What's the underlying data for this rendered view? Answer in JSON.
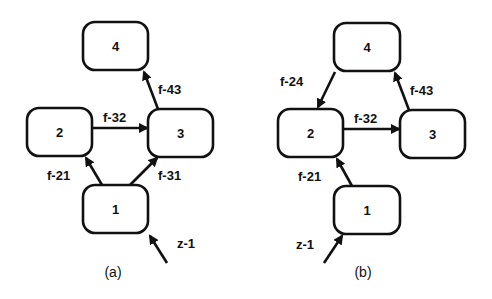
{
  "panels": [
    {
      "label": "(a)",
      "nodes": [
        {
          "id": "4",
          "label": "4"
        },
        {
          "id": "2",
          "label": "2"
        },
        {
          "id": "3",
          "label": "3"
        },
        {
          "id": "1",
          "label": "1"
        }
      ],
      "edges": [
        {
          "from": "1",
          "to": "2",
          "label": "f-21"
        },
        {
          "from": "1",
          "to": "3",
          "label": "f-31"
        },
        {
          "from": "2",
          "to": "3",
          "label": "f-32"
        },
        {
          "from": "3",
          "to": "4",
          "label": "f-43"
        }
      ],
      "input": {
        "to": "1",
        "label": "z-1"
      }
    },
    {
      "label": "(b)",
      "nodes": [
        {
          "id": "4",
          "label": "4"
        },
        {
          "id": "2",
          "label": "2"
        },
        {
          "id": "3",
          "label": "3"
        },
        {
          "id": "1",
          "label": "1"
        }
      ],
      "edges": [
        {
          "from": "4",
          "to": "2",
          "label": "f-24"
        },
        {
          "from": "2",
          "to": "3",
          "label": "f-32"
        },
        {
          "from": "3",
          "to": "4",
          "label": "f-43"
        },
        {
          "from": "1",
          "to": "2",
          "label": "f-21"
        }
      ],
      "input": {
        "to": "1",
        "label": "z-1"
      }
    }
  ],
  "colors": {
    "stroke": "#111111",
    "background": "#ffffff"
  }
}
